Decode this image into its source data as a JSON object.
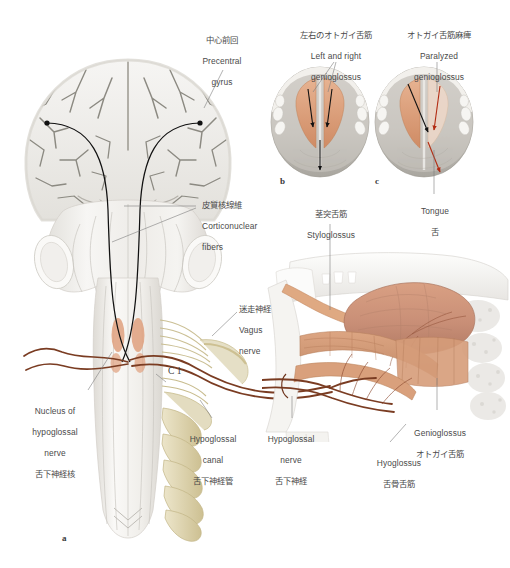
{
  "figure": {
    "background_color": "#ffffff",
    "width": 510,
    "height": 568
  },
  "palette": {
    "bone_light": "#f4f3f1",
    "bone_shadow": "#d8d6d2",
    "brain_gray": "#eceae6",
    "sulcus_gray": "#8c8a82",
    "muscle_salmon": "#e0a07e",
    "muscle_salmon_dark": "#c98560",
    "tongue_flesh": "#c98f77",
    "nerve_cream": "#e3dcc0",
    "nerve_cream_dark": "#c8bc8e",
    "nerve_brown": "#7a3c22",
    "tract_black": "#111111",
    "arrow_red": "#b22b12",
    "leader_gray": "#7d7d7d",
    "text_gray": "#4a4a4a"
  },
  "panel_letters": [
    {
      "id": "a",
      "text": "a"
    },
    {
      "id": "b",
      "text": "b"
    },
    {
      "id": "c",
      "text": "c"
    }
  ],
  "labels": {
    "precentral_gyrus": {
      "ja": "中心前回",
      "en_line1": "Precentral",
      "en_line2": "gyrus"
    },
    "left_right_genioglossus": {
      "ja": "左右のオトガイ舌筋",
      "en_line1": "Left and right",
      "en_line2": "genioglossus"
    },
    "paralyzed_genioglossus": {
      "ja": "オトガイ舌筋麻痺",
      "en_line1": "Paralyzed",
      "en_line2": "genioglossus"
    },
    "corticonuclear_fibers": {
      "ja": "皮質核線維",
      "en_line1": "Corticonuclear",
      "en_line2": "fibers"
    },
    "styloglossus": {
      "ja": "茎突舌筋",
      "en_line1": "Styloglossus"
    },
    "vagus_nerve": {
      "ja": "迷走神経",
      "en_line1": "Vagus",
      "en_line2": "nerve"
    },
    "tongue": {
      "en_line1": "Tongue",
      "ja": "舌"
    },
    "nucleus_of_hypoglossal_nerve": {
      "en_line1": "Nucleus of",
      "en_line2": "hypoglossal",
      "en_line3": "nerve",
      "ja": "舌下神経核"
    },
    "hypoglossal_canal": {
      "en_line1": "Hypoglossal",
      "en_line2": "canal",
      "ja": "舌下神経管"
    },
    "hypoglossal_nerve": {
      "en_line1": "Hypoglossal",
      "en_line2": "nerve",
      "ja": "舌下神経"
    },
    "genioglossus": {
      "en_line1": "Genioglossus",
      "ja": "オトガイ舌筋"
    },
    "hyoglossus": {
      "en_line1": "Hyoglossus",
      "ja": "舌骨舌筋"
    },
    "c1_spinal_nerve": {
      "text": "C 1"
    }
  }
}
